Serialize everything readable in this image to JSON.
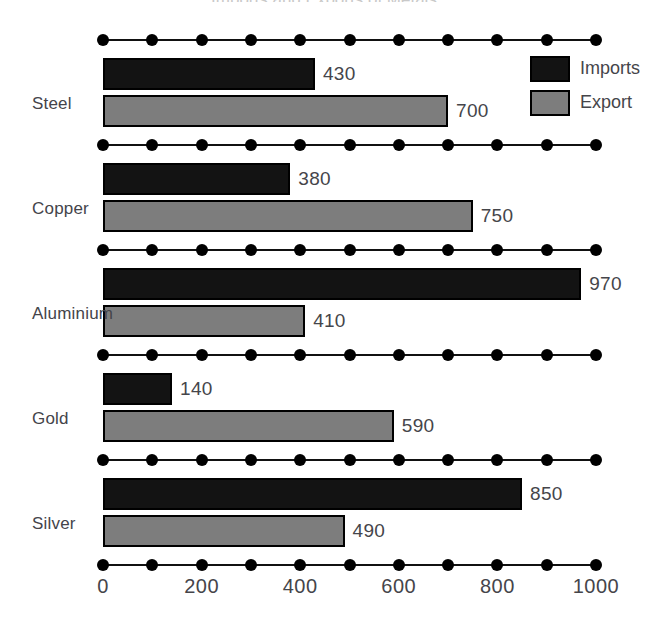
{
  "chart_data": {
    "type": "bar",
    "orientation": "horizontal",
    "title": "Imports and Exports of Metals",
    "categories": [
      "Steel",
      "Copper",
      "Aluminium",
      "Gold",
      "Silver"
    ],
    "series": [
      {
        "name": "Imports",
        "color": "#131313",
        "values": [
          430,
          380,
          970,
          140,
          850
        ]
      },
      {
        "name": "Export",
        "color": "#7d7d7d",
        "values": [
          700,
          750,
          410,
          590,
          490
        ]
      }
    ],
    "xlabel": "",
    "ylabel": "",
    "xlim": [
      0,
      1000
    ],
    "x_tick_labels": [
      "0",
      "200",
      "400",
      "600",
      "800",
      "1000"
    ],
    "x_tick_values": [
      0,
      200,
      400,
      600,
      800,
      1000
    ],
    "x_dot_values": [
      0,
      100,
      200,
      300,
      400,
      500,
      600,
      700,
      800,
      900,
      1000
    ],
    "grid": false,
    "legend_position": "top-right",
    "data_labels": true
  },
  "legend": {
    "items": [
      {
        "label": "Imports",
        "swatch": "imports"
      },
      {
        "label": "Export",
        "swatch": "export"
      }
    ]
  },
  "colors": {
    "imports": "#131313",
    "export": "#7d7d7d",
    "axis": "#000000",
    "text": "#45454a"
  }
}
